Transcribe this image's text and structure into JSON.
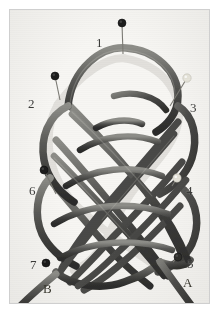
{
  "figure": {
    "kind": "photograph",
    "background_color": "#f7f6f3",
    "border_color": "#cfcfcf",
    "page_color": "#ffffff",
    "cord_color": "#4a4a48",
    "cord_highlight": "#8d8d88",
    "cord_shadow": "#2b2b2a",
    "label_color": "#3a3a38"
  },
  "pins": [
    {
      "id": "1",
      "label": "1",
      "head_color": "#1c1c1c",
      "head_kind": "dark",
      "head_x": 122,
      "head_y": 23,
      "tip_x": 123,
      "tip_y": 54,
      "label_x": 96,
      "label_y": 36
    },
    {
      "id": "2",
      "label": "2",
      "head_color": "#1c1c1c",
      "head_kind": "dark",
      "head_x": 55,
      "head_y": 76,
      "tip_x": 60,
      "tip_y": 100,
      "label_x": 28,
      "label_y": 97
    },
    {
      "id": "3",
      "label": "3",
      "head_color": "#e8e6dc",
      "head_kind": "light",
      "head_x": 187,
      "head_y": 78,
      "tip_x": 170,
      "tip_y": 106,
      "label_x": 190,
      "label_y": 101
    },
    {
      "id": "4",
      "label": "4",
      "head_color": "#e4e2d8",
      "head_kind": "light",
      "head_x": 177,
      "head_y": 178,
      "tip_x": 172,
      "tip_y": 186,
      "label_x": 186,
      "label_y": 184
    },
    {
      "id": "5",
      "label": "5",
      "head_color": "#2a2a28",
      "head_kind": "dark",
      "head_x": 178,
      "head_y": 257,
      "tip_x": 173,
      "tip_y": 262,
      "label_x": 187,
      "label_y": 257
    },
    {
      "id": "6",
      "label": "6",
      "head_color": "#1c1c1c",
      "head_kind": "dark",
      "head_x": 44,
      "head_y": 170,
      "tip_x": 56,
      "tip_y": 194,
      "label_x": 29,
      "label_y": 184
    },
    {
      "id": "7",
      "label": "7",
      "head_color": "#121212",
      "head_kind": "dark",
      "head_x": 46,
      "head_y": 263,
      "tip_x": 46,
      "tip_y": 263,
      "label_x": 30,
      "label_y": 258
    }
  ],
  "endpoints": [
    {
      "id": "A",
      "label": "A",
      "label_x": 183,
      "label_y": 276,
      "direction": "lower-right"
    },
    {
      "id": "B",
      "label": "B",
      "label_x": 43,
      "label_y": 282,
      "direction": "lower-left"
    }
  ]
}
